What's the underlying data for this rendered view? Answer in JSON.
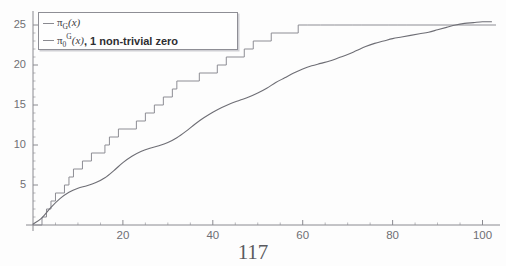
{
  "figure": {
    "page_number": "117",
    "cut_off_title": "",
    "background_color": "#fdfdfd",
    "axis_color": "#8a8a90",
    "step_curve_color": "#8d8d94",
    "smooth_curve_color": "#6e6e75",
    "legend_border_color": "#8e8e95"
  },
  "legend": {
    "position": "top-left",
    "entries": [
      {
        "symbol_prefix": "π",
        "symbol_sub": "G",
        "symbol_sup": "",
        "symbol_arg": "(x)",
        "note": "",
        "swatch_color": "#8a8a90"
      },
      {
        "symbol_prefix": "π",
        "symbol_sub": "0",
        "symbol_sup": "G",
        "symbol_arg": "(x)",
        "note": ", 1 non-trivial zero",
        "swatch_color": "#8a8a90"
      }
    ]
  },
  "chart_data": {
    "type": "line",
    "title": "",
    "subtitle": "",
    "xlabel": "",
    "ylabel": "",
    "xlim": [
      0,
      103
    ],
    "ylim": [
      0,
      26.5
    ],
    "grid": false,
    "legend_position": "upper-left",
    "x_ticks_major": [
      20,
      40,
      60,
      80,
      100
    ],
    "x_ticks_minor": [
      5,
      10,
      15,
      25,
      30,
      35,
      45,
      50,
      55,
      65,
      70,
      75,
      85,
      90,
      95
    ],
    "y_ticks_major": [
      5,
      10,
      15,
      20,
      25
    ],
    "y_ticks_minor": [
      1,
      2,
      3,
      4,
      6,
      7,
      8,
      9,
      11,
      12,
      13,
      14,
      16,
      17,
      18,
      19,
      21,
      22,
      23,
      24
    ],
    "series": [
      {
        "name": "pi_G(x)",
        "style": "step-post",
        "color": "#8d8d94",
        "description": "Counting step function, jumps of 1 at each prime-like element",
        "jump_points": [
          2,
          3,
          4,
          5,
          7,
          8,
          9,
          11,
          13,
          16,
          17,
          19,
          23,
          25,
          27,
          29,
          31,
          32,
          37,
          41,
          43,
          47,
          49,
          53,
          59,
          61,
          64,
          67,
          71,
          73,
          79,
          81,
          83,
          89,
          97
        ],
        "x": [
          0,
          2,
          3,
          4,
          5,
          7,
          8,
          9,
          11,
          13,
          16,
          17,
          19,
          23,
          25,
          27,
          29,
          31,
          32,
          37,
          41,
          43,
          47,
          49,
          53,
          59,
          61,
          64,
          67,
          71,
          73,
          79,
          81,
          83,
          89,
          97,
          103
        ],
        "y": [
          0,
          1,
          2,
          3,
          4,
          5,
          6,
          7,
          8,
          9,
          10,
          11,
          12,
          13,
          14,
          15,
          16,
          17,
          18,
          19,
          20,
          21,
          22,
          23,
          24,
          25,
          25,
          25,
          25,
          25,
          25,
          25,
          25,
          25,
          25,
          25,
          25
        ]
      },
      {
        "name": "pi_0^G(x), 1 non-trivial zero",
        "style": "smooth",
        "color": "#6e6e75",
        "description": "Smooth oscillating approximation using one non-trivial zero",
        "x": [
          0,
          2,
          4,
          6,
          8,
          10,
          12,
          14,
          16,
          18,
          20,
          22,
          24,
          26,
          28,
          30,
          32,
          34,
          36,
          38,
          40,
          42,
          44,
          46,
          48,
          50,
          52,
          54,
          56,
          58,
          60,
          62,
          64,
          66,
          68,
          70,
          72,
          74,
          76,
          78,
          80,
          82,
          84,
          86,
          88,
          90,
          92,
          94,
          96,
          98,
          100,
          102
        ],
        "y": [
          0.1,
          0.9,
          2.2,
          3.3,
          4.1,
          4.6,
          4.9,
          5.3,
          5.9,
          6.8,
          7.8,
          8.6,
          9.2,
          9.6,
          9.9,
          10.3,
          10.9,
          11.7,
          12.6,
          13.4,
          14.1,
          14.7,
          15.2,
          15.6,
          16.0,
          16.5,
          17.1,
          17.8,
          18.4,
          19.0,
          19.5,
          19.9,
          20.2,
          20.5,
          20.9,
          21.3,
          21.8,
          22.3,
          22.7,
          23.0,
          23.3,
          23.5,
          23.7,
          23.9,
          24.1,
          24.4,
          24.7,
          25.0,
          25.2,
          25.3,
          25.4,
          25.4
        ]
      }
    ]
  }
}
